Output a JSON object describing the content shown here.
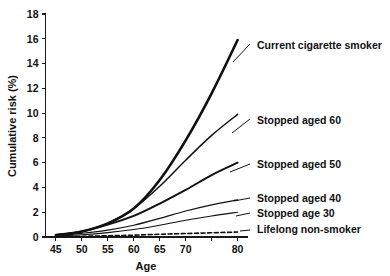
{
  "chart_data": {
    "type": "line",
    "title": "",
    "xlabel": "Age",
    "ylabel": "Cumulative risk (%)",
    "xlim": [
      43,
      82
    ],
    "ylim": [
      0,
      18
    ],
    "grid": false,
    "legend_position": "right-inline-labels",
    "xticks": [
      45,
      50,
      55,
      60,
      65,
      70,
      75,
      80
    ],
    "xtick_labels": [
      "45",
      "50",
      "55",
      "60",
      "65",
      "70",
      "",
      "80"
    ],
    "yticks": [
      0,
      2,
      4,
      6,
      8,
      10,
      12,
      14,
      16,
      18
    ],
    "ytick_labels": [
      "0",
      "2",
      "4",
      "6",
      "8",
      "10",
      "12",
      "14",
      "16",
      "18"
    ],
    "x": [
      45,
      50,
      55,
      60,
      65,
      70,
      75,
      80
    ],
    "series": [
      {
        "name": "Current cigarette smoker",
        "label": "Current cigarette smoker",
        "style": "solid",
        "width": 2.6,
        "values": [
          0.15,
          0.45,
          1.1,
          2.3,
          4.6,
          7.8,
          11.6,
          15.9
        ]
      },
      {
        "name": "Stopped aged 60",
        "label": "Stopped aged 60",
        "style": "solid",
        "width": 1.5,
        "values": [
          0.15,
          0.45,
          1.1,
          2.3,
          4.1,
          6.2,
          8.2,
          9.9
        ]
      },
      {
        "name": "Stopped aged 50",
        "label": "Stopped aged 50",
        "style": "solid",
        "width": 2.0,
        "values": [
          0.15,
          0.45,
          1.0,
          1.7,
          2.7,
          3.8,
          5.0,
          6.0
        ]
      },
      {
        "name": "Stopped aged 40",
        "label": "Stopped aged 40",
        "style": "solid",
        "width": 1.2,
        "values": [
          0.12,
          0.3,
          0.55,
          0.95,
          1.5,
          2.1,
          2.6,
          3.0
        ]
      },
      {
        "name": "Stopped age 30",
        "label": "Stopped age 30",
        "style": "solid",
        "width": 1.1,
        "values": [
          0.08,
          0.18,
          0.35,
          0.6,
          0.95,
          1.35,
          1.7,
          2.0
        ]
      },
      {
        "name": "Lifelong non-smoker",
        "label": "Lifelong non-smoker",
        "style": "dashed",
        "width": 1.6,
        "values": [
          0.03,
          0.06,
          0.1,
          0.15,
          0.22,
          0.28,
          0.34,
          0.4
        ]
      }
    ]
  },
  "colors": {
    "line": "#111111",
    "axis": "#1a1a1a",
    "background": "#ffffff"
  }
}
